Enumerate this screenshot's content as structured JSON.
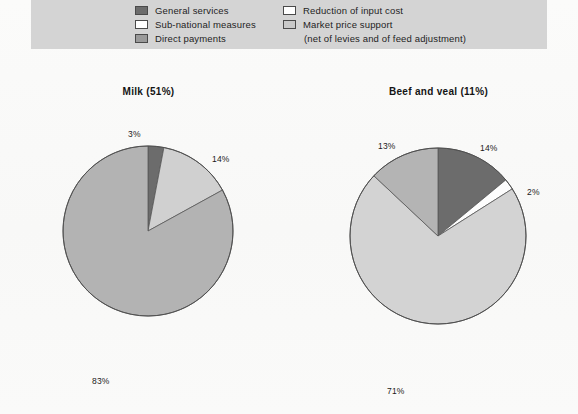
{
  "legend": {
    "columns": [
      {
        "items": [
          {
            "label": "General services",
            "swatch": "#6c6c6c",
            "icon": "legend-swatch-dark"
          },
          {
            "label": "Sub-national measures",
            "swatch": "#ffffff",
            "icon": "legend-swatch-white"
          },
          {
            "label": "Direct payments",
            "swatch": "#9a9a9a",
            "icon": "legend-swatch-medium"
          }
        ]
      },
      {
        "items": [
          {
            "label": "Reduction of input cost",
            "swatch": "#ffffff",
            "icon": "legend-swatch-white"
          },
          {
            "label": "Market price support",
            "swatch": "#c9c9c9",
            "icon": "legend-swatch-light",
            "sublabel": "(net of levies and of feed adjustment)"
          }
        ]
      }
    ],
    "background": "#d4d4d4"
  },
  "chart_data": [
    {
      "type": "pie",
      "id": "milk",
      "title": "Milk (51%)",
      "categories": [
        "General services",
        "Market price support",
        "Direct payments"
      ],
      "values": [
        3,
        14,
        83
      ],
      "labels": [
        "3%",
        "14%",
        "83%"
      ],
      "colors": [
        "#6c6c6c",
        "#d0d0d0",
        "#b3b3b3"
      ],
      "start_angle": 0,
      "direction": "clockwise",
      "center": [
        148,
        217
      ],
      "radius": 85,
      "label_positions": [
        [
          129,
          121
        ],
        [
          213,
          146
        ],
        [
          93,
          368
        ]
      ]
    },
    {
      "type": "pie",
      "id": "beef",
      "title": "Beef and veal (11%)",
      "categories": [
        "General services",
        "Sub-national measures",
        "Market price support",
        "Direct payments"
      ],
      "values": [
        14,
        2,
        71,
        13
      ],
      "labels": [
        "14%",
        "2%",
        "71%",
        "13%"
      ],
      "colors": [
        "#6c6c6c",
        "#fdfdfd",
        "#d3d3d3",
        "#b4b4b4"
      ],
      "start_angle": 0,
      "direction": "clockwise",
      "center": [
        438,
        222
      ],
      "radius": 88,
      "label_positions": [
        [
          480,
          135
        ],
        [
          527,
          179
        ],
        [
          387,
          378
        ],
        [
          378,
          133
        ]
      ]
    }
  ]
}
